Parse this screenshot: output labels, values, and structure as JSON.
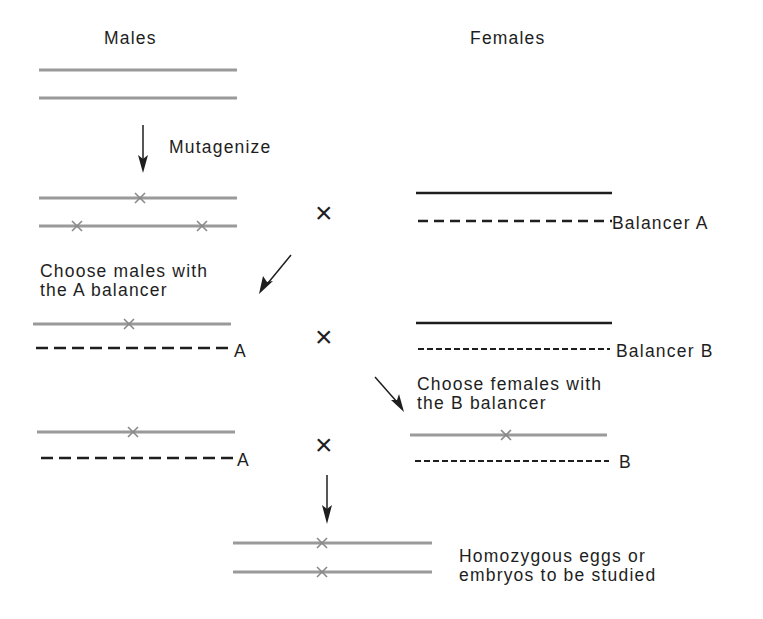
{
  "headers": {
    "males": "Males",
    "females": "Females"
  },
  "steps": {
    "mutagenize": "Mutagenize",
    "choose_males_line1": "Choose males with",
    "choose_males_line2": "the A balancer",
    "choose_females_line1": "Choose females with",
    "choose_females_line2": " the B balancer",
    "result_line1": "Homozygous eggs or",
    "result_line2": "embryos to be studied"
  },
  "labels": {
    "balancer_a": "Balancer A",
    "balancer_b": "Balancer B",
    "a_short_1": "A",
    "a_short_2": "A",
    "b_short": "B"
  },
  "cross_symbol": "×",
  "colors": {
    "mutant_chromosome": "#9a9a9a",
    "wildtype_chromosome": "#1e1e1e",
    "balancer": "#1e1e1e",
    "text": "#1e1e1e",
    "background": "#ffffff"
  }
}
